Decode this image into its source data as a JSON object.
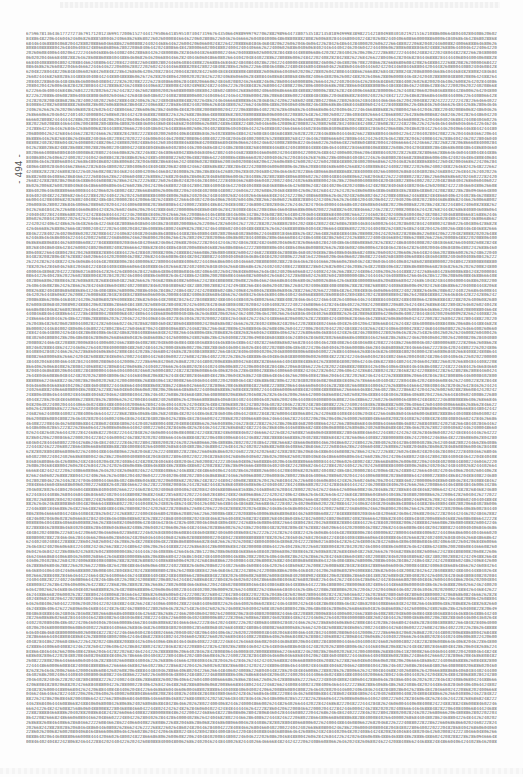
{
  "document": {
    "page_number": "- 494 -",
    "content_type": "dense numeric digit listing",
    "first_line_prefix": "67596781364361772727367917120123699172006152744417950664185951073047319676435066498899979270628829896447380753518213581894999838982214218049803010219215162",
    "lines": 150,
    "chars_per_line": 182
  }
}
